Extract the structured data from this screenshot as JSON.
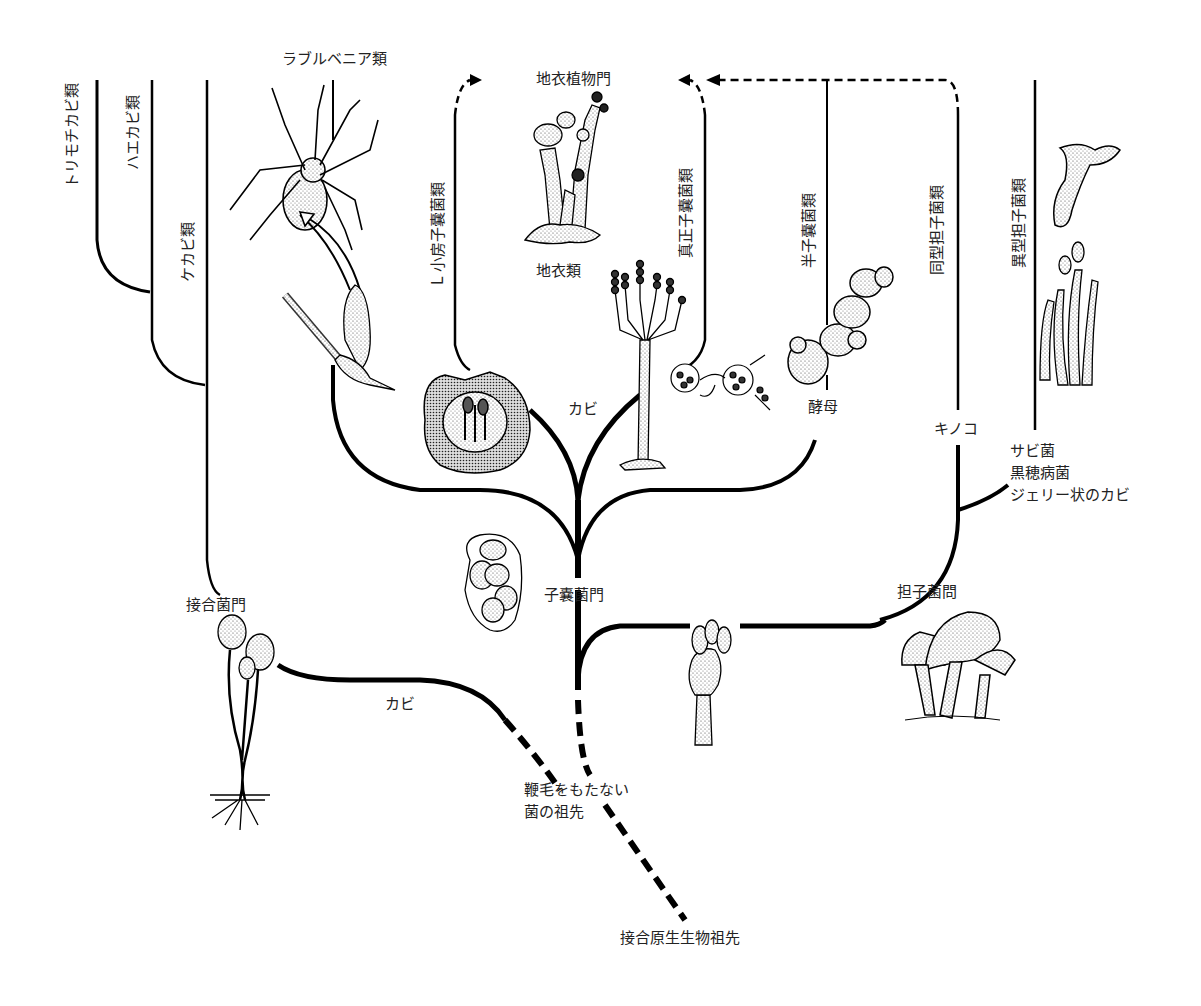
{
  "diagram": {
    "type": "phylogenetic-tree",
    "labels": {
      "torimochi": "トリモチカビ類",
      "haekabi": "ハエカビ類",
      "kekabi": "ケカビ類",
      "laboulbenia": "ラブルベニア類",
      "lichen_phylum": "地衣植物門",
      "small_chamber": "L 小房子嚢菌類",
      "true_ascomycetes": "真正子嚢菌類",
      "lichens": "地衣類",
      "hemiascomycetes": "半子嚢菌類",
      "homobasidio": "同型担子菌類",
      "heterobasidio": "異型担子菌類",
      "kabi_asco": "カビ",
      "yeast": "酵母",
      "kinoko": "キノコ",
      "rusts_group": "サビ菌\n黒穂病菌\nジェリー状のカビ",
      "ascomycota": "子嚢菌門",
      "basidiomycota": "担子菌問",
      "zygomycota": "接合菌門",
      "kabi_zygo": "カビ",
      "non_flagellate_ancestor": "鞭毛をもたない\n菌の祖先",
      "protist_ancestor": "接合原生生物祖先"
    },
    "illustrations": [
      "spider-with-laboulbenia",
      "laboulbenia-thallus",
      "lichen-cladonia",
      "perithecium-cross-section",
      "penicillium-conidiophore",
      "ascus-hyphae",
      "budding-yeast",
      "ascus-with-spores",
      "basidium",
      "mushrooms",
      "jelly-fungus",
      "rust-teliospores",
      "rhizopus-sporangia"
    ],
    "colors": {
      "line": "#000000",
      "background": "#ffffff",
      "text": "#222222"
    }
  }
}
